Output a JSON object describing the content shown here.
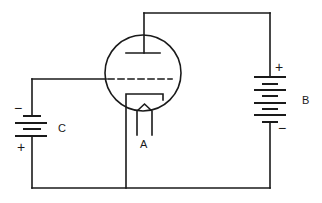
{
  "diagram": {
    "stroke_color": "#1a1a1a",
    "background": "#ffffff",
    "labels": {
      "filament": "A",
      "plate_battery": "B",
      "grid_battery": "C"
    },
    "battery_b": {
      "positive_sign": "+",
      "negative_sign": "−"
    },
    "battery_c": {
      "positive_sign": "+",
      "negative_sign": "−"
    },
    "components": [
      "triode-tube",
      "plate",
      "grid",
      "cathode",
      "filament",
      "battery-b",
      "battery-c"
    ]
  }
}
